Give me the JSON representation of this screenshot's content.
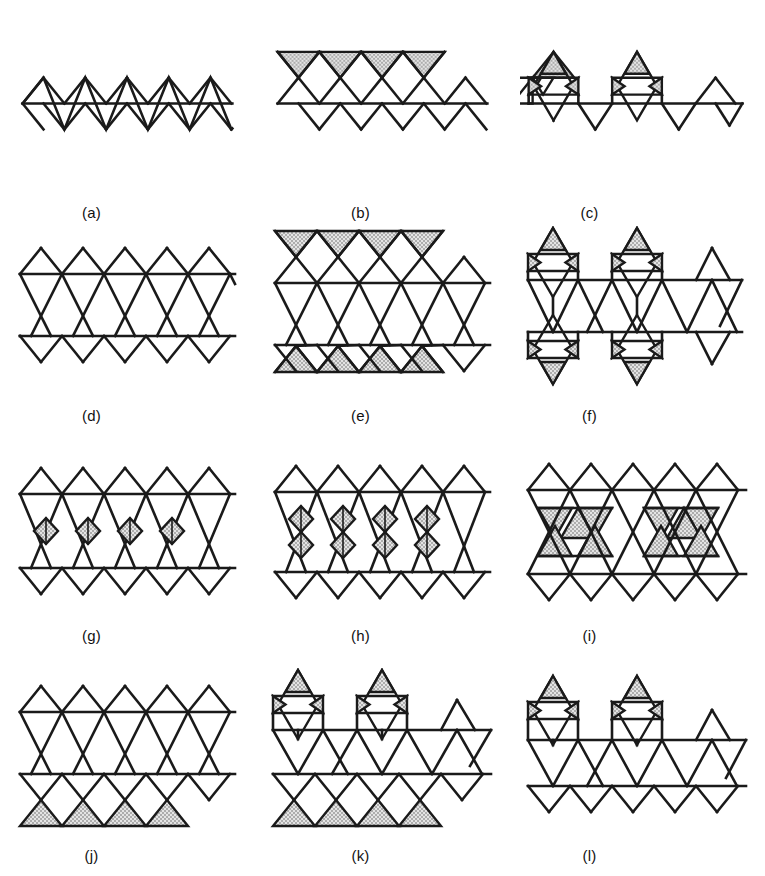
{
  "figure": {
    "stroke_color": "#1a1a1a",
    "stipple_color": "#d8d8d8",
    "background_color": "#ffffff",
    "stroke_width": 2.6,
    "rows": 4,
    "columns": 3,
    "panel_count": 12
  },
  "panels": [
    {
      "id": "a",
      "label": "(a)",
      "rows_of_triangles": 1,
      "description": "Single zigzag chain of up and down triangles on one horizontal baseline",
      "baselines": 1,
      "up_triangles": 5,
      "down_triangles": 5,
      "shaded_shapes": 0,
      "shaded_type": "none",
      "shaded_position": "none"
    },
    {
      "id": "b",
      "label": "(b)",
      "rows_of_triangles": 1,
      "description": "Zigzag chain with stippled inverted triangles forming bowties on top",
      "baselines": 1,
      "up_triangles": 5,
      "down_triangles": 5,
      "shaded_shapes": 4,
      "shaded_type": "down-triangle",
      "shaded_position": "top"
    },
    {
      "id": "c",
      "label": "(c)",
      "rows_of_triangles": 1,
      "description": "Zigzag chain with two hexagram stars having stippled points on top",
      "baselines": 1,
      "up_triangles": 5,
      "down_triangles": 5,
      "shaded_shapes": 6,
      "shaded_type": "star-points",
      "shaded_position": "top"
    },
    {
      "id": "d",
      "label": "(d)",
      "rows_of_triangles": 2,
      "description": "Double zigzag strip, two parallel baselines, no shading",
      "baselines": 2,
      "up_triangles": 9,
      "down_triangles": 9,
      "shaded_shapes": 0,
      "shaded_type": "none",
      "shaded_position": "none"
    },
    {
      "id": "e",
      "label": "(e)",
      "rows_of_triangles": 2,
      "description": "Double strip with stippled bowtie triangles on top and bottom edges",
      "baselines": 2,
      "up_triangles": 9,
      "down_triangles": 9,
      "shaded_shapes": 8,
      "shaded_type": "bowtie-triangle",
      "shaded_position": "top-and-bottom"
    },
    {
      "id": "f",
      "label": "(f)",
      "rows_of_triangles": 2,
      "description": "Double strip with hexagram stars on top and bottom, stippled points",
      "baselines": 2,
      "up_triangles": 9,
      "down_triangles": 9,
      "shaded_shapes": 12,
      "shaded_type": "star-points",
      "shaded_position": "top-and-bottom"
    },
    {
      "id": "g",
      "label": "(g)",
      "rows_of_triangles": 2,
      "description": "Double strip with small stippled rhombi at mid-row crossings",
      "baselines": 2,
      "up_triangles": 9,
      "down_triangles": 9,
      "shaded_shapes": 4,
      "shaded_type": "rhombus",
      "shaded_position": "middle"
    },
    {
      "id": "h",
      "label": "(h)",
      "rows_of_triangles": 2,
      "description": "Double strip with two horizontal rows of stippled rhombi",
      "baselines": 2,
      "up_triangles": 9,
      "down_triangles": 9,
      "shaded_shapes": 8,
      "shaded_type": "rhombus",
      "shaded_position": "middle-two-rows"
    },
    {
      "id": "i",
      "label": "(i)",
      "rows_of_triangles": 2,
      "description": "Double strip with stippled interior triangles around hexagonal vacancies",
      "baselines": 2,
      "up_triangles": 9,
      "down_triangles": 9,
      "shaded_shapes": 12,
      "shaded_type": "interior-triangle",
      "shaded_position": "interior"
    },
    {
      "id": "j",
      "label": "(j)",
      "rows_of_triangles": 2,
      "description": "Double strip with stippled bowtie triangles along the bottom only",
      "baselines": 2,
      "up_triangles": 9,
      "down_triangles": 9,
      "shaded_shapes": 4,
      "shaded_type": "bowtie-triangle",
      "shaded_position": "bottom"
    },
    {
      "id": "k",
      "label": "(k)",
      "rows_of_triangles": 2,
      "description": "Double strip with hexagram stars on top and stippled bowties on bottom",
      "baselines": 2,
      "up_triangles": 9,
      "down_triangles": 9,
      "shaded_shapes": 10,
      "shaded_type": "star-points-and-bowtie",
      "shaded_position": "top-and-bottom"
    },
    {
      "id": "l",
      "label": "(l)",
      "rows_of_triangles": 2,
      "description": "Double strip with hexagram stars having stippled points on top only",
      "baselines": 2,
      "up_triangles": 9,
      "down_triangles": 9,
      "shaded_shapes": 6,
      "shaded_type": "star-points",
      "shaded_position": "top"
    }
  ]
}
